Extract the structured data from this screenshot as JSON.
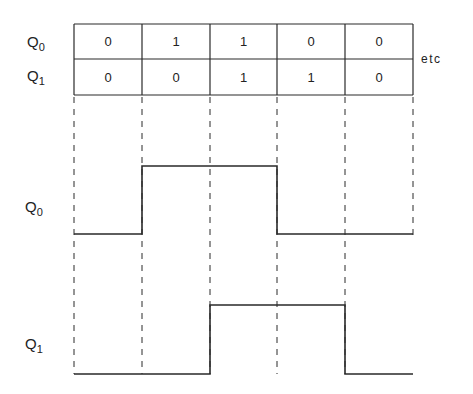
{
  "table": {
    "rows": [
      {
        "name": "Q",
        "sub": "0",
        "values": [
          "0",
          "1",
          "1",
          "0",
          "0"
        ]
      },
      {
        "name": "Q",
        "sub": "1",
        "values": [
          "0",
          "0",
          "1",
          "1",
          "0"
        ]
      }
    ],
    "continuation": "etc"
  },
  "waveforms": [
    {
      "name": "Q",
      "sub": "0",
      "states": [
        0,
        1,
        1,
        0,
        0
      ]
    },
    {
      "name": "Q",
      "sub": "1",
      "states": [
        0,
        0,
        1,
        1,
        0
      ]
    }
  ],
  "colors": {
    "line": "#2a2a2a",
    "background": "#ffffff"
  }
}
